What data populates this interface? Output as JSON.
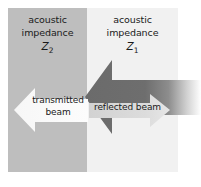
{
  "figure": {
    "width": 201,
    "height": 187,
    "background": "#ffffff"
  },
  "regions": [
    {
      "id": "z2",
      "name": "left-medium",
      "line1": "acoustic",
      "line2": "impedance",
      "symbol": "Z",
      "subscript": "2",
      "color": "#bebebe"
    },
    {
      "id": "z1",
      "name": "right-medium",
      "line1": "acoustic",
      "line2": "impedance",
      "symbol": "Z",
      "subscript": "1",
      "color": "#f1f1f1"
    }
  ],
  "arrows": [
    {
      "id": "incident",
      "label": "",
      "direction": "left",
      "color_start": "#6e6e6e",
      "color_end": "#ffffff",
      "description": "large dark arrow pointing left, fading out toward the right edge"
    },
    {
      "id": "transmitted",
      "label": "transmitted beam",
      "label_line1": "transmitted",
      "label_line2": "beam",
      "direction": "left",
      "color": "#fbfbfb",
      "description": "white arrow pointing left inside the Z2 medium"
    },
    {
      "id": "reflected",
      "label": "reflected beam",
      "direction": "right",
      "color": "#d8d8d8",
      "description": "light gray arrow pointing right, drawn on top of the dark arrow"
    }
  ],
  "colors": {
    "medium_left": "#bebebe",
    "medium_right": "#f1f1f1",
    "dark_arrow": "#6e6e6e",
    "light_arrow": "#d8d8d8",
    "white_arrow": "#fbfbfb",
    "text": "#1a1a1a",
    "background": "#ffffff"
  }
}
